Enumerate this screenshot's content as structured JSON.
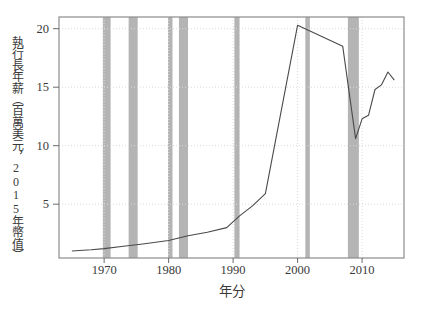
{
  "chart_data": {
    "type": "line",
    "title": "",
    "xlabel": "年分",
    "ylabel": "執行長年薪（百萬美元，2015年幣值）",
    "x_ticks": [
      1970,
      1980,
      1990,
      2000,
      2010
    ],
    "y_ticks": [
      5,
      10,
      15,
      20
    ],
    "xlim": [
      1963,
      2016.5
    ],
    "ylim": [
      0.4,
      21
    ],
    "grid": true,
    "series": [
      {
        "name": "executive-annual-pay",
        "x": [
          1965,
          1968,
          1970,
          1973,
          1976,
          1980,
          1983,
          1986,
          1989,
          1991,
          1993,
          1995,
          2000,
          2007,
          2009,
          2010,
          2011,
          2012,
          2013,
          2014,
          2015
        ],
        "y": [
          1.0,
          1.1,
          1.2,
          1.4,
          1.6,
          1.9,
          2.3,
          2.6,
          3.0,
          4.0,
          4.85,
          5.9,
          20.3,
          18.5,
          10.6,
          12.3,
          12.6,
          14.8,
          15.2,
          16.3,
          15.6
        ]
      }
    ],
    "recession_bands": [
      [
        1969.8,
        1971.0
      ],
      [
        1973.8,
        1975.2
      ],
      [
        1979.9,
        1980.6
      ],
      [
        1981.6,
        1983.0
      ],
      [
        1990.2,
        1991.0
      ],
      [
        2001.2,
        2001.9
      ],
      [
        2007.8,
        2009.5
      ]
    ],
    "colors": {
      "line": "#4a4a4a",
      "band": "#b4b4b4",
      "grid": "#dbdbdb",
      "box": "#8c8c8c",
      "tick": "#6b6b6b",
      "text": "#3a3a3a",
      "background": "#ffffff"
    }
  }
}
